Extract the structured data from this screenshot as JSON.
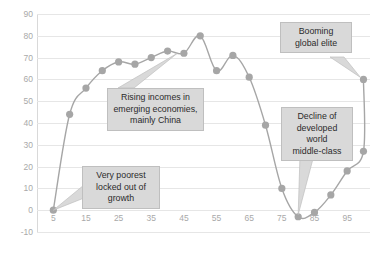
{
  "chart_data": {
    "type": "line",
    "title": "",
    "xlabel": "",
    "ylabel": "Real income growth, %",
    "xlim": [
      0,
      102
    ],
    "ylim": [
      -10,
      90
    ],
    "grid": true,
    "legend": "none",
    "yticks": [
      90,
      80,
      70,
      60,
      50,
      40,
      30,
      20,
      10,
      0,
      -10
    ],
    "ytick_labels": [
      "90",
      "80",
      "70",
      "60",
      "50",
      "40",
      "30",
      "20",
      "10",
      "0",
      "-10"
    ],
    "xticks": [
      5,
      15,
      25,
      35,
      45,
      55,
      65,
      75,
      85,
      95
    ],
    "xtick_labels": [
      "5",
      "15",
      "25",
      "35",
      "45",
      "55",
      "65",
      "75",
      "85",
      "95"
    ],
    "x": [
      5,
      10,
      15,
      20,
      25,
      30,
      35,
      40,
      45,
      50,
      55,
      60,
      65,
      70,
      75,
      80,
      85,
      90,
      95,
      100
    ],
    "values": [
      0,
      44,
      56,
      64,
      68,
      67,
      70,
      73,
      72,
      80,
      64,
      71,
      61,
      39,
      10,
      -3,
      -1,
      7,
      18,
      27
    ],
    "series": [
      {
        "name": "Real income growth",
        "values": [
          0,
          44,
          56,
          64,
          68,
          67,
          70,
          73,
          72,
          80,
          64,
          71,
          61,
          39,
          10,
          -3,
          -1,
          7,
          18,
          27
        ]
      }
    ],
    "extra_point": {
      "x": 100,
      "y": 60
    },
    "line_color": "#a6a6a6",
    "marker_color": "#a6a6a6",
    "grid_color": "#e6e6e6",
    "tick_color": "#a9a9a9",
    "annotations": [
      {
        "id": "very-poorest",
        "text_lines": [
          "Very poorest",
          "locked out of",
          "growth"
        ]
      },
      {
        "id": "rising-incomes",
        "text_lines": [
          "Rising incomes in",
          "emerging economies,",
          "mainly China"
        ]
      },
      {
        "id": "booming-elite",
        "text_lines": [
          "Booming",
          "global elite"
        ]
      },
      {
        "id": "decline-middle",
        "text_lines": [
          "Decline of",
          "developed",
          "world",
          "middle-class"
        ]
      }
    ]
  }
}
